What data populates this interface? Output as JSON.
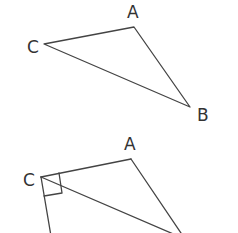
{
  "diagram": {
    "top_triangle": {
      "labels": {
        "A": "A",
        "B": "B",
        "C": "C"
      }
    },
    "bottom_figure": {
      "labels": {
        "A": "A",
        "C": "C"
      },
      "right_angle_at": "C"
    },
    "colors": {
      "stroke": "#444444",
      "text": "#333333",
      "background": "#ffffff"
    }
  }
}
